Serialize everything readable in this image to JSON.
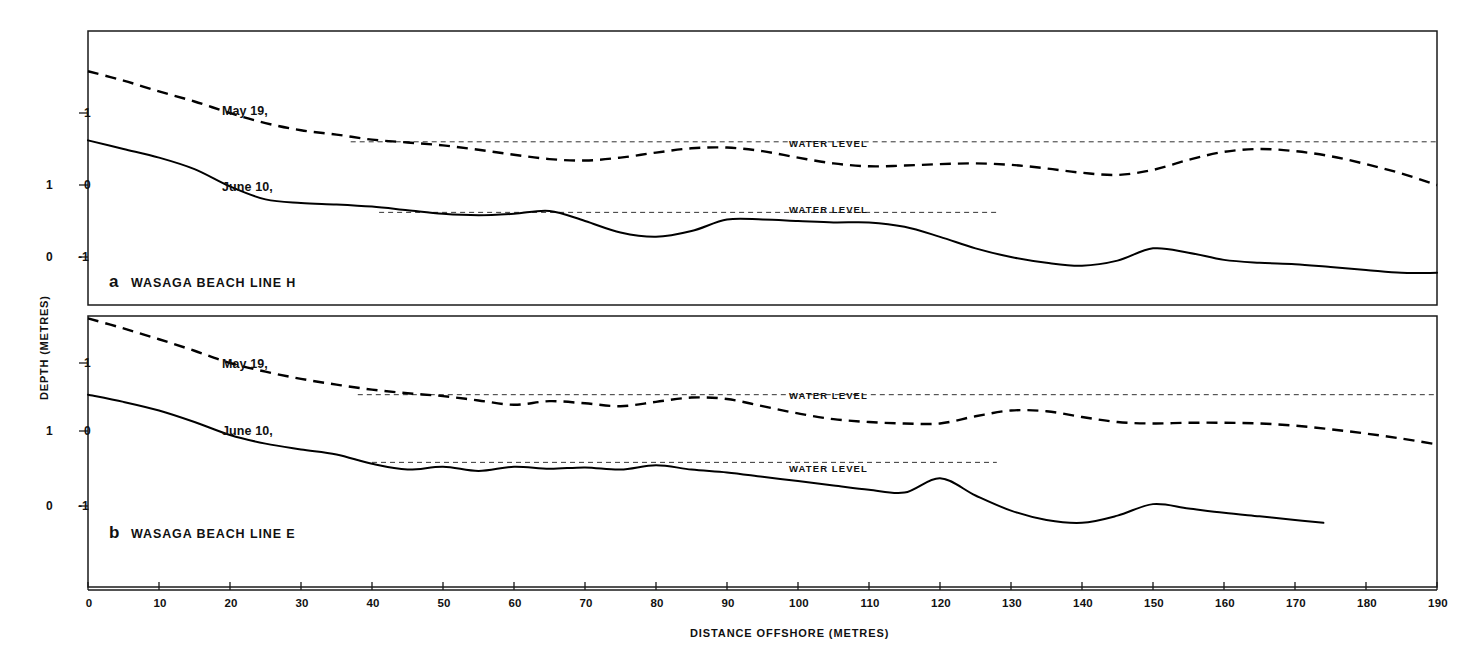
{
  "figure": {
    "width": 1471,
    "height": 661,
    "background": "#ffffff",
    "ink_color": "#000000"
  },
  "axes": {
    "x_title": "DISTANCE OFFSHORE (METRES)",
    "y_title": "DEPTH (METRES)",
    "x_ticks": [
      0,
      10,
      20,
      30,
      40,
      50,
      60,
      70,
      80,
      90,
      100,
      110,
      120,
      130,
      140,
      150,
      160,
      170,
      180,
      190
    ],
    "x_tick_labels": [
      "0",
      "10",
      "20",
      "30",
      "40",
      "50",
      "60",
      "70",
      "80",
      "90",
      "100",
      "110",
      "120",
      "130",
      "140",
      "150",
      "160",
      "170",
      "180",
      "190"
    ],
    "x_min": 0,
    "x_max": 190,
    "y_inner_tick_labels": [
      "1",
      "0",
      "-1"
    ],
    "y_outer_tick_labels": [
      "1",
      "0"
    ],
    "y_min": -1.85,
    "y_max": 1.75
  },
  "annotations": {
    "water_level": "WATER LEVEL",
    "may_label": "May 19,",
    "june_label": "June 10,"
  },
  "panels": [
    {
      "letter": "a",
      "caption": "WASAGA BEACH   LINE H",
      "id": "panel-a"
    },
    {
      "letter": "b",
      "caption": "WASAGA BEACH   LINE E",
      "id": "panel-b"
    }
  ],
  "chart_data": {
    "type": "line",
    "xlabel": "DISTANCE OFFSHORE (METRES)",
    "ylabel": "DEPTH (METRES)",
    "xlim": [
      0,
      190
    ],
    "ylim": [
      -1.85,
      1.75
    ],
    "grid": false,
    "legend": "inline curve labels",
    "panels": [
      {
        "letter": "a",
        "caption": "WASAGA BEACH   LINE H",
        "water_level_may": 0.6,
        "water_level_june": -0.38,
        "series": [
          {
            "name": "May 19,",
            "style": "dashed",
            "x": [
              0,
              5,
              10,
              15,
              20,
              25,
              30,
              35,
              40,
              45,
              50,
              55,
              60,
              65,
              70,
              75,
              80,
              85,
              90,
              95,
              100,
              105,
              110,
              115,
              120,
              125,
              130,
              135,
              140,
              145,
              150,
              155,
              160,
              165,
              170,
              175,
              180,
              185,
              190
            ],
            "y": [
              1.58,
              1.45,
              1.3,
              1.16,
              1.0,
              0.86,
              0.76,
              0.7,
              0.63,
              0.59,
              0.55,
              0.49,
              0.42,
              0.36,
              0.34,
              0.38,
              0.45,
              0.51,
              0.52,
              0.47,
              0.38,
              0.3,
              0.26,
              0.27,
              0.29,
              0.3,
              0.28,
              0.23,
              0.17,
              0.14,
              0.21,
              0.35,
              0.46,
              0.5,
              0.47,
              0.4,
              0.29,
              0.16,
              0.0
            ]
          },
          {
            "name": "June 10,",
            "style": "solid",
            "x": [
              0,
              5,
              10,
              15,
              20,
              25,
              30,
              35,
              40,
              45,
              50,
              55,
              60,
              65,
              70,
              75,
              80,
              85,
              90,
              95,
              100,
              105,
              110,
              115,
              120,
              125,
              130,
              135,
              140,
              145,
              150,
              155,
              160,
              165,
              170,
              175,
              180,
              185,
              190
            ],
            "y": [
              0.62,
              0.5,
              0.38,
              0.22,
              -0.02,
              -0.2,
              -0.25,
              -0.27,
              -0.3,
              -0.35,
              -0.4,
              -0.42,
              -0.4,
              -0.36,
              -0.5,
              -0.66,
              -0.72,
              -0.64,
              -0.48,
              -0.48,
              -0.5,
              -0.52,
              -0.52,
              -0.58,
              -0.72,
              -0.88,
              -1.0,
              -1.08,
              -1.12,
              -1.05,
              -0.88,
              -0.94,
              -1.04,
              -1.08,
              -1.1,
              -1.14,
              -1.18,
              -1.22,
              -1.22
            ]
          }
        ]
      },
      {
        "letter": "b",
        "caption": "WASAGA BEACH   LINE E",
        "water_level_may": 0.56,
        "water_level_june": -0.38,
        "series": [
          {
            "name": "May 19,",
            "style": "dashed",
            "x": [
              0,
              5,
              10,
              15,
              20,
              25,
              30,
              35,
              40,
              45,
              50,
              55,
              60,
              65,
              70,
              75,
              80,
              85,
              90,
              95,
              100,
              105,
              110,
              115,
              120,
              125,
              130,
              135,
              140,
              145,
              150,
              155,
              160,
              165,
              170,
              175,
              180,
              185,
              190
            ],
            "y": [
              1.62,
              1.48,
              1.33,
              1.17,
              1.0,
              0.88,
              0.78,
              0.7,
              0.63,
              0.58,
              0.54,
              0.48,
              0.42,
              0.47,
              0.44,
              0.4,
              0.46,
              0.52,
              0.5,
              0.4,
              0.3,
              0.22,
              0.18,
              0.16,
              0.16,
              0.26,
              0.34,
              0.33,
              0.25,
              0.18,
              0.16,
              0.17,
              0.17,
              0.16,
              0.13,
              0.08,
              0.02,
              -0.05,
              -0.13
            ]
          },
          {
            "name": "June 10,",
            "style": "solid",
            "x": [
              0,
              5,
              10,
              15,
              20,
              25,
              30,
              35,
              40,
              45,
              50,
              55,
              60,
              65,
              70,
              75,
              80,
              85,
              90,
              95,
              100,
              105,
              110,
              115,
              120,
              125,
              130,
              135,
              140,
              145,
              150,
              155,
              160,
              165,
              170,
              174
            ],
            "y": [
              0.56,
              0.46,
              0.34,
              0.18,
              0.0,
              -0.12,
              -0.2,
              -0.27,
              -0.4,
              -0.48,
              -0.44,
              -0.5,
              -0.44,
              -0.47,
              -0.45,
              -0.48,
              -0.42,
              -0.48,
              -0.52,
              -0.58,
              -0.64,
              -0.7,
              -0.76,
              -0.8,
              -0.6,
              -0.84,
              -1.05,
              -1.18,
              -1.22,
              -1.12,
              -0.96,
              -1.02,
              -1.08,
              -1.13,
              -1.18,
              -1.22
            ]
          }
        ]
      }
    ]
  }
}
